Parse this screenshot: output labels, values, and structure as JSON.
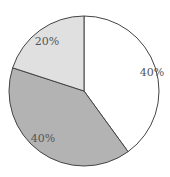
{
  "chart_data": {
    "type": "pie",
    "title": "",
    "categories": [
      "Slice A",
      "Slice B",
      "Slice C"
    ],
    "values": [
      40,
      40,
      20
    ],
    "labels": [
      "40%",
      "40%",
      "20%"
    ],
    "colors": [
      "#ffffff",
      "#b3b3b3",
      "#e0e0e0"
    ],
    "start_angle_deg": 0,
    "direction": "clockwise",
    "legend": "none",
    "grid": false
  },
  "geometry": {
    "cx": 84,
    "cy": 91,
    "r": 75
  }
}
